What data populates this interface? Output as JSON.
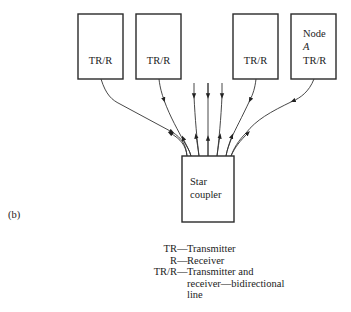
{
  "figure": {
    "label": "(b)",
    "nodes": [
      {
        "id": "node1",
        "lines": [
          "",
          "",
          "TR/R"
        ]
      },
      {
        "id": "node2",
        "lines": [
          "",
          "",
          "TR/R"
        ]
      },
      {
        "id": "node3",
        "lines": [
          "",
          "",
          "TR/R"
        ]
      },
      {
        "id": "node4",
        "lines": [
          "Node",
          "A",
          "TR/R"
        ]
      }
    ],
    "hub": {
      "lines": [
        "Star",
        "coupler"
      ]
    },
    "connections": [
      {
        "from": "node1",
        "to": "hub",
        "type": "bidirectional"
      },
      {
        "from": "node2",
        "to": "hub",
        "type": "bidirectional"
      },
      {
        "from": "hub",
        "to": "R",
        "type": "output",
        "count": 3
      },
      {
        "from": "node3",
        "to": "hub",
        "type": "bidirectional"
      },
      {
        "from": "node4",
        "to": "hub",
        "type": "bidirectional"
      }
    ]
  },
  "legend": [
    {
      "key": "TR",
      "text": "Transmitter"
    },
    {
      "key": "R",
      "text": "Receiver"
    },
    {
      "key": "TR/R",
      "text": "Transmitter and",
      "continuation": [
        "receiver—bidirectional",
        "line"
      ]
    }
  ],
  "legend_dash": "—"
}
